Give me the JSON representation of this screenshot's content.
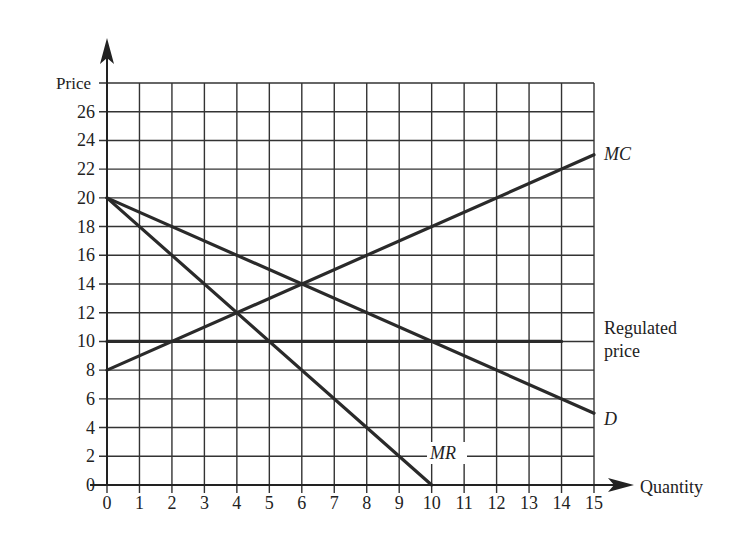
{
  "chart_data": {
    "type": "line",
    "title": "",
    "xlabel": "Quantity",
    "ylabel": "Price",
    "xlim": [
      0,
      15
    ],
    "ylim": [
      0,
      28
    ],
    "grid": true,
    "x_ticks": [
      0,
      1,
      2,
      3,
      4,
      5,
      6,
      7,
      8,
      9,
      10,
      11,
      12,
      13,
      14,
      15
    ],
    "y_ticks": [
      0,
      2,
      4,
      6,
      8,
      10,
      12,
      14,
      16,
      18,
      20,
      22,
      24,
      26
    ],
    "series": [
      {
        "name": "MC",
        "label": "MC",
        "x": [
          0,
          15
        ],
        "y": [
          8,
          23
        ]
      },
      {
        "name": "D",
        "label": "D",
        "x": [
          0,
          15
        ],
        "y": [
          20,
          5
        ]
      },
      {
        "name": "MR",
        "label": "MR",
        "x": [
          0,
          10
        ],
        "y": [
          20,
          0
        ]
      },
      {
        "name": "Regulated price",
        "label": "Regulated price",
        "x": [
          0,
          14
        ],
        "y": [
          10,
          10
        ]
      }
    ],
    "annotations": [
      "MC",
      "D",
      "MR",
      "Regulated price"
    ]
  },
  "axes": {
    "x_title": "Quantity",
    "y_title": "Price"
  },
  "labels": {
    "mc": "MC",
    "d": "D",
    "mr": "MR",
    "regulated_line1": "Regulated",
    "regulated_line2": "price"
  },
  "colors": {
    "line": "#2a2a2a",
    "grid": "#333333",
    "background": "#ffffff"
  }
}
